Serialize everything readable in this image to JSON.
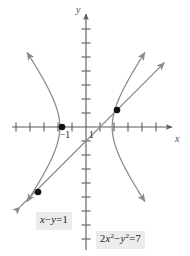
{
  "figure": {
    "kind": "coordinate-plane-with-curves",
    "colors": {
      "axis": "#5a5a5a",
      "curve": "#8a8a8a",
      "line": "#8a8a8a",
      "point": "#121212",
      "label_background": "#ececed",
      "label_text": "#1a1a1a",
      "background": "#ffffff"
    },
    "axes": {
      "x_axis_label": "x",
      "y_axis_label": "y",
      "x_tick_labels": [
        "−1",
        "1"
      ],
      "y_tick_labels": [],
      "origin_px": [
        86,
        127
      ],
      "unit_px": 14,
      "x_arrow": "right",
      "y_arrow": "up",
      "x_tick_count_left": 5,
      "x_tick_count_right": 5,
      "y_tick_count_up": 7,
      "y_tick_count_down": 8,
      "grid": false
    },
    "labels": {
      "line_equation": "x − y = 1",
      "line_equation_parts": {
        "lhs_x": "x",
        "minus": "−",
        "lhs_y": "y",
        "equals": "=",
        "rhs": "1"
      },
      "hyperbola_equation": "2x² − y² = 7",
      "hyperbola_equation_parts": {
        "coef": "2",
        "var1": "x",
        "exp1": "2",
        "minus": "−",
        "var2": "y",
        "exp2": "2",
        "equals": "=",
        "rhs": "7"
      }
    },
    "points": [
      {
        "name": "left-branch-vertex",
        "px": [
          62,
          127
        ]
      },
      {
        "name": "upper-right-intersection",
        "px": [
          117,
          110
        ]
      },
      {
        "name": "lower-left-intersection",
        "px": [
          38,
          192
        ]
      }
    ]
  },
  "chart_data": {
    "type": "line",
    "title": "",
    "xlabel": "x",
    "ylabel": "y",
    "xlim": [
      -6,
      7
    ],
    "ylim": [
      -8,
      8
    ],
    "grid": false,
    "legend": "inline-labels",
    "xticks": [
      -5,
      -4,
      -3,
      -2,
      -1,
      1,
      2,
      3,
      4,
      5
    ],
    "xtick_labels_shown": {
      "-1": "−1",
      "1": "1"
    },
    "yticks": [
      -8,
      -7,
      -6,
      -5,
      -4,
      -3,
      -2,
      -1,
      1,
      2,
      3,
      4,
      5,
      6,
      7
    ],
    "ytick_labels_shown": {},
    "series": [
      {
        "name": "2x² − y² = 7",
        "kind": "hyperbola",
        "equation": "2x^2 - y^2 = 7",
        "a_squared": 3.5,
        "b_squared": 7,
        "vertices": [
          [
            -1.871,
            0
          ],
          [
            1.871,
            0
          ]
        ],
        "asymptote_slopes": [
          1.4142,
          -1.4142
        ],
        "branches": [
          "left",
          "right"
        ],
        "arrowheads": 4,
        "color": "#8a8a8a"
      },
      {
        "name": "x − y = 1",
        "kind": "line",
        "equation": "x - y = 1",
        "slope": 1,
        "intercept": -1,
        "x_intercept": 1,
        "y_intercept": -1,
        "arrowheads": 2,
        "color": "#8a8a8a"
      }
    ],
    "annotated_points": [
      {
        "label": "",
        "x": -1.871,
        "y": 0
      },
      {
        "label": "",
        "x": 2.2,
        "y": 1.2
      },
      {
        "label": "",
        "x": -3.4,
        "y": -4.4
      }
    ]
  }
}
